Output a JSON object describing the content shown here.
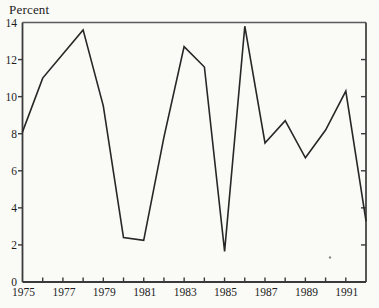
{
  "chart_data": {
    "type": "line",
    "title": "",
    "ylabel": "Percent",
    "xlabel": "",
    "x": [
      1975,
      1976,
      1977,
      1978,
      1979,
      1980,
      1981,
      1982,
      1983,
      1984,
      1985,
      1986,
      1987,
      1988,
      1989,
      1990,
      1991,
      1992
    ],
    "values": [
      8.1,
      11.0,
      12.3,
      13.6,
      9.5,
      2.4,
      2.25,
      7.8,
      12.7,
      11.6,
      1.65,
      13.8,
      7.5,
      8.7,
      6.7,
      8.2,
      10.3,
      3.3
    ],
    "series": [
      {
        "name": "percent-series",
        "values": [
          8.1,
          11.0,
          12.3,
          13.6,
          9.5,
          2.4,
          2.25,
          7.8,
          12.7,
          11.6,
          1.65,
          13.8,
          7.5,
          8.7,
          6.7,
          8.2,
          10.3,
          3.3
        ]
      }
    ],
    "xlim": [
      1975,
      1992
    ],
    "ylim": [
      0,
      14
    ],
    "y_tick_values": [
      0,
      2,
      4,
      6,
      8,
      10,
      12,
      14
    ],
    "y_tick_labels": [
      "0",
      "2",
      "4",
      "6",
      "8",
      "10",
      "12",
      "14"
    ],
    "y_side_tick_values": [
      2,
      4,
      6,
      8,
      10,
      12
    ],
    "x_minor_tick_years": [
      1976,
      1977,
      1978,
      1979,
      1980,
      1981,
      1982,
      1983,
      1984,
      1985,
      1986,
      1987,
      1988,
      1989,
      1990,
      1991
    ],
    "x_tick_labels": [
      "1975",
      "1977",
      "1979",
      "1981",
      "1983",
      "1985",
      "1987",
      "1989",
      "1991"
    ],
    "x_label_years": [
      1975,
      1977,
      1979,
      1981,
      1983,
      1985,
      1987,
      1989,
      1991
    ],
    "grid": false,
    "legend": "none",
    "frame": "box",
    "line_color": "#272727",
    "axis_color": "#3a3a3a",
    "frame_light_color": "#5a5a5a",
    "text_color": "#1c1c1c",
    "background_color": "#fafaf7"
  }
}
